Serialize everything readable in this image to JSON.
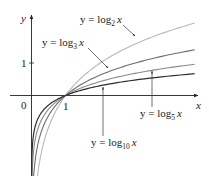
{
  "chart_data": {
    "type": "line",
    "title": "",
    "xlabel": "x",
    "ylabel": "y",
    "origin_label": "0",
    "x_ticks": [
      {
        "value": 1,
        "label": "1"
      }
    ],
    "y_ticks": [
      {
        "value": 1,
        "label": "1"
      }
    ],
    "xlim": [
      -0.6,
      4.9
    ],
    "ylim": [
      -2.5,
      2.5
    ],
    "grid": false,
    "legend": "annotations",
    "series": [
      {
        "name": "y = log2 x",
        "base": 2,
        "color": "#b8b8b8",
        "label_text": "y = log",
        "label_sub": "2",
        "label_var": "x",
        "x": [
          0.1,
          0.25,
          0.5,
          1,
          2,
          3,
          4,
          4.8
        ],
        "y": [
          -3.32,
          -2.0,
          -1.0,
          0,
          1.0,
          1.58,
          2.0,
          2.26
        ]
      },
      {
        "name": "y = log3 x",
        "base": 3,
        "color": "#6e6e6e",
        "label_text": "y = log",
        "label_sub": "3",
        "label_var": "x",
        "x": [
          0.1,
          0.25,
          0.5,
          1,
          2,
          3,
          4,
          4.8
        ],
        "y": [
          -2.1,
          -1.26,
          -0.63,
          0,
          0.63,
          1.0,
          1.26,
          1.43
        ]
      },
      {
        "name": "y = log5 x",
        "base": 5,
        "color": "#8a8a8a",
        "label_text": "y = log",
        "label_sub": "5",
        "label_var": "x",
        "x": [
          0.1,
          0.25,
          0.5,
          1,
          2,
          3,
          4,
          4.8
        ],
        "y": [
          -1.43,
          -0.86,
          -0.43,
          0,
          0.43,
          0.68,
          0.86,
          0.97
        ]
      },
      {
        "name": "y = log10 x",
        "base": 10,
        "color": "#2e2e2e",
        "label_text": "y = log",
        "label_sub": "10",
        "label_var": "x",
        "x": [
          0.1,
          0.25,
          0.5,
          1,
          2,
          3,
          4,
          4.8
        ],
        "y": [
          -1.0,
          -0.6,
          -0.3,
          0,
          0.3,
          0.48,
          0.6,
          0.68
        ]
      }
    ]
  }
}
